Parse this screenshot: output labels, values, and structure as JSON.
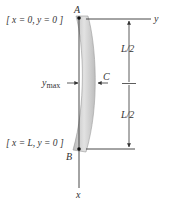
{
  "diagram": {
    "labels": {
      "point_a": "A",
      "point_b": "B",
      "point_c": "C",
      "axis_y": "y",
      "axis_x": "x",
      "ymax_main": "y",
      "ymax_sub": "max",
      "half_length_top": "L/2",
      "half_length_bottom": "L/2",
      "bc_top": "[ x = 0, y = 0 ]",
      "bc_bottom": "[ x = L, y = 0 ]"
    },
    "colors": {
      "line": "#333333",
      "beam_fill": "#cfcfcf",
      "beam_edge": "#9a9a9a",
      "text": "#333333"
    }
  }
}
